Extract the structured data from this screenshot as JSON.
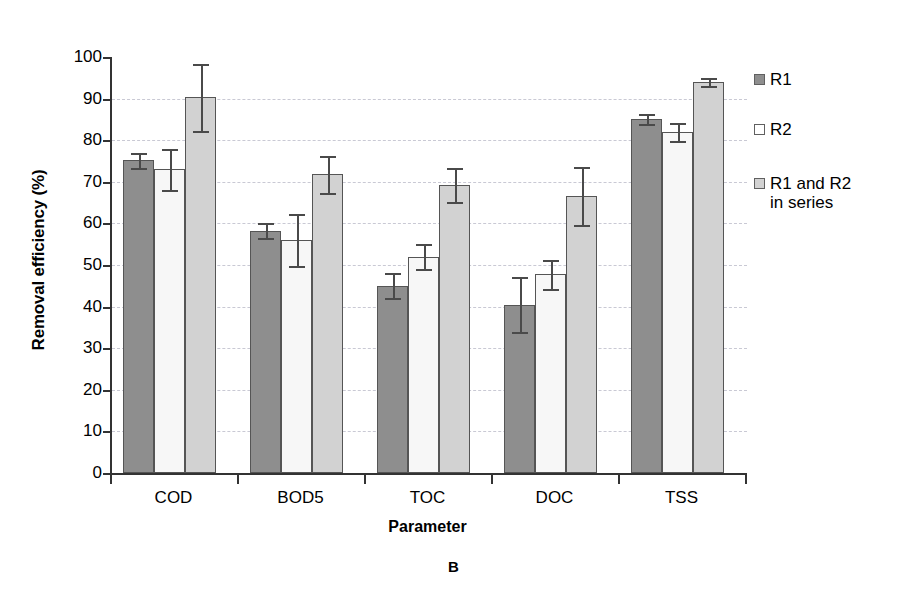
{
  "chart_data": {
    "type": "bar",
    "title": "",
    "panel_label": "B",
    "xlabel": "Parameter",
    "ylabel": "Removal efficiency (%)",
    "ylim": [
      0,
      100
    ],
    "ytick_values": [
      0,
      10,
      20,
      30,
      40,
      50,
      60,
      70,
      80,
      90,
      100
    ],
    "ytick_labels": [
      "0",
      "10",
      "20",
      "30",
      "40",
      "50",
      "60",
      "70",
      "80",
      "90",
      "100"
    ],
    "grid": true,
    "legend_position": "right",
    "categories": [
      "COD",
      "BOD5",
      "TOC",
      "DOC",
      "TSS"
    ],
    "series": [
      {
        "name": "R1",
        "color": "#8e8e8e",
        "values": [
          75.2,
          58.2,
          45.0,
          40.5,
          85.0
        ],
        "errors": [
          1.8,
          1.8,
          3.0,
          6.5,
          1.2
        ]
      },
      {
        "name": "R2",
        "color": "#f7f7f7",
        "values": [
          73.0,
          56.0,
          52.0,
          47.8,
          82.0
        ],
        "errors": [
          5.0,
          6.2,
          3.0,
          3.5,
          2.2
        ]
      },
      {
        "name": "R1 and R2\nin series",
        "color": "#d2d2d2",
        "values": [
          90.3,
          71.8,
          69.2,
          66.5,
          94.0
        ],
        "errors": [
          8.0,
          4.5,
          4.0,
          7.0,
          1.0
        ]
      }
    ]
  },
  "legend": {
    "entries": [
      {
        "label": "R1",
        "swatch": "s0"
      },
      {
        "label": "R2",
        "swatch": "s1"
      },
      {
        "label": "R1 and R2\nin series",
        "swatch": "s2"
      }
    ]
  },
  "axes": {
    "y_title": "Removal efficiency (%)",
    "x_title": "Parameter"
  },
  "caption": {
    "panel": "B"
  }
}
